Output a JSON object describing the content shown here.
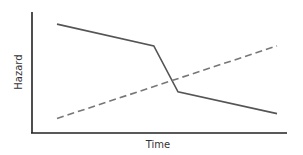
{
  "chart_data": {
    "type": "line",
    "title": "",
    "xlabel": "Time",
    "ylabel": "Hazard",
    "grid": false,
    "legend": null,
    "x_ticks": [],
    "y_ticks": [],
    "xlim": [
      0,
      10
    ],
    "ylim": [
      0,
      10
    ],
    "series": [
      {
        "name": "solid",
        "style": "solid",
        "color": "#555555",
        "points": [
          [
            1,
            9.0
          ],
          [
            5.4,
            7.2
          ],
          [
            6.5,
            3.4
          ],
          [
            11,
            1.6
          ]
        ]
      },
      {
        "name": "dashed",
        "style": "dashed",
        "color": "#777777",
        "points": [
          [
            1,
            1.2
          ],
          [
            11,
            7.2
          ]
        ]
      }
    ]
  },
  "colors": {
    "axis": "#222222",
    "solid_line": "#555555",
    "dashed_line": "#777777",
    "background": "#ffffff"
  }
}
